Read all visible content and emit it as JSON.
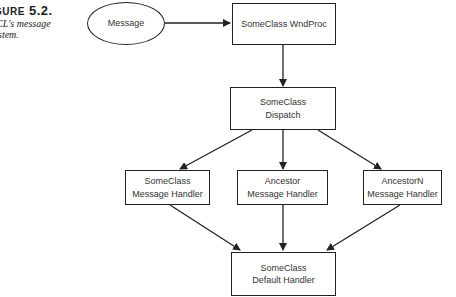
{
  "caption": {
    "figure_prefix": "GURE",
    "figure_number": "5.2.",
    "line1": "CL's message",
    "line2": "stem."
  },
  "nodes": {
    "message": {
      "label": "Message"
    },
    "wndproc": {
      "label": "SomeClass WndProc"
    },
    "dispatch": {
      "line1": "SomeClass",
      "line2": "Dispatch"
    },
    "handler_someclass": {
      "line1": "SomeClass",
      "line2": "Message Handler"
    },
    "handler_ancestor": {
      "line1": "Ancestor",
      "line2": "Message Handler"
    },
    "handler_ancestorn": {
      "line1": "AncestorN",
      "line2": "Message Handler"
    },
    "default_handler": {
      "line1": "SomeClass",
      "line2": "Default Handler"
    }
  },
  "edges": [
    {
      "from": "message",
      "to": "wndproc"
    },
    {
      "from": "wndproc",
      "to": "dispatch"
    },
    {
      "from": "dispatch",
      "to": "handler_someclass"
    },
    {
      "from": "dispatch",
      "to": "handler_ancestor"
    },
    {
      "from": "dispatch",
      "to": "handler_ancestorn"
    },
    {
      "from": "handler_someclass",
      "to": "default_handler"
    },
    {
      "from": "handler_ancestor",
      "to": "default_handler"
    },
    {
      "from": "handler_ancestorn",
      "to": "default_handler"
    }
  ],
  "colors": {
    "stroke": "#222222",
    "text": "#333333",
    "background": "#ffffff"
  }
}
